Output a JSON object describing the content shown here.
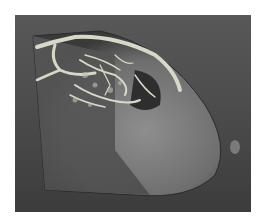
{
  "image": {
    "subject": "3D volume rendering of breast model with vasculature",
    "colors": {
      "background": "#4e4e4e",
      "border": "#ffffff",
      "tissue_light": "#8a8a8a",
      "tissue_dark": "#5e5e5e",
      "vessels": "#d8d8c8"
    }
  }
}
